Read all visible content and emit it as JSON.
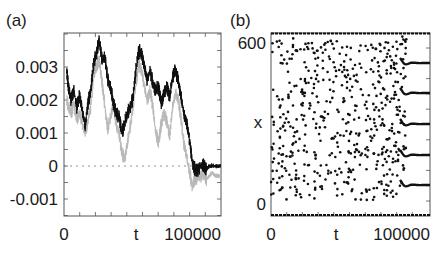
{
  "chart_data": [
    {
      "panel_label": "(a)",
      "type": "line",
      "xlabel": "t",
      "ylabel": "",
      "xlim": [
        0,
        112000
      ],
      "ylim": [
        -0.0015,
        0.004
      ],
      "x_tick_labels": [
        "0",
        "t",
        "100000"
      ],
      "y_ticks": [
        0.003,
        0.002,
        0.001,
        0,
        -0.001
      ],
      "y_tick_labels": [
        "0.003",
        "0.002",
        "0.001",
        "0",
        "-0.001"
      ],
      "reference_line": {
        "y": 0,
        "style": "dashed"
      },
      "series": [
        {
          "name": "black",
          "color": "#111111",
          "x": [
            2000,
            3000,
            5000,
            7000,
            9000,
            11000,
            13000,
            15000,
            17000,
            19000,
            21000,
            23000,
            25000,
            27000,
            29000,
            31000,
            33000,
            35000,
            37000,
            39000,
            41000,
            43000,
            45000,
            47000,
            49000,
            51000,
            53000,
            55000,
            57000,
            59000,
            61000,
            63000,
            65000,
            67000,
            69000,
            71000,
            73000,
            75000,
            77000,
            79000,
            81000,
            83000,
            85000,
            87000,
            89000,
            91000,
            93000,
            95000,
            97000,
            99000,
            100000,
            101000,
            103000,
            105000,
            107000,
            109000,
            111000
          ],
          "values": [
            0.0029,
            0.0024,
            0.002,
            0.0023,
            0.0018,
            0.0021,
            0.0017,
            0.0012,
            0.0019,
            0.0023,
            0.0031,
            0.0034,
            0.0038,
            0.0032,
            0.0033,
            0.0026,
            0.0024,
            0.0019,
            0.0016,
            0.0015,
            0.001,
            0.0013,
            0.0016,
            0.0018,
            0.0021,
            0.0029,
            0.0035,
            0.0034,
            0.003,
            0.0026,
            0.0029,
            0.0025,
            0.0023,
            0.0024,
            0.0019,
            0.0022,
            0.0024,
            0.0021,
            0.0027,
            0.0029,
            0.0026,
            0.0021,
            0.0016,
            0.0013,
            0.0008,
            0.0001,
            -0.0001,
            -0.0001,
            0.0,
            0.0,
            0.0,
            -0.0001,
            0.0,
            0.0,
            0.0,
            0.0,
            0.0
          ]
        },
        {
          "name": "gray",
          "color": "#b8b8b8",
          "x": [
            2000,
            3000,
            5000,
            7000,
            9000,
            11000,
            13000,
            15000,
            17000,
            19000,
            21000,
            23000,
            25000,
            27000,
            29000,
            31000,
            33000,
            35000,
            37000,
            39000,
            41000,
            43000,
            45000,
            47000,
            49000,
            51000,
            53000,
            55000,
            57000,
            59000,
            61000,
            63000,
            65000,
            67000,
            69000,
            71000,
            73000,
            75000,
            77000,
            79000,
            81000,
            83000,
            85000,
            87000,
            89000,
            91000,
            93000,
            95000,
            97000,
            99000,
            100000,
            101000,
            103000,
            105000,
            107000,
            109000,
            111000
          ],
          "values": [
            0.002,
            0.0018,
            0.0016,
            0.0019,
            0.0014,
            0.0016,
            0.0013,
            0.001,
            0.0014,
            0.0018,
            0.0028,
            0.003,
            0.0032,
            0.0025,
            0.0018,
            0.0011,
            0.0015,
            0.0019,
            0.0013,
            0.001,
            0.0004,
            0.0002,
            0.0007,
            0.0012,
            0.0018,
            0.0025,
            0.0031,
            0.0029,
            0.0024,
            0.002,
            0.0023,
            0.0018,
            0.001,
            0.0007,
            0.0013,
            0.0016,
            0.0013,
            0.0009,
            0.0018,
            0.0022,
            0.002,
            0.0014,
            0.0007,
            0.0003,
            -0.0002,
            -0.0006,
            -0.0004,
            -0.0003,
            -0.0003,
            -0.0002,
            -0.0003,
            -0.0004,
            -0.0003,
            -0.0002,
            -0.0003,
            -0.0003,
            -0.0003
          ]
        }
      ]
    },
    {
      "panel_label": "(b)",
      "type": "scatter",
      "xlabel": "t",
      "ylabel": "x",
      "xlim": [
        0,
        112000
      ],
      "ylim": [
        -70,
        670
      ],
      "x_tick_labels": [
        "0",
        "t",
        "100000"
      ],
      "y_tick_labels": [
        "600",
        "0"
      ],
      "boundary_bands": [
        0,
        640
      ],
      "converged_levels": [
        100,
        230,
        370,
        510,
        640
      ],
      "transition_start_t": 93000,
      "note": "Scattered points for t<95000, converging onto five horizontal lines afterwards"
    }
  ]
}
